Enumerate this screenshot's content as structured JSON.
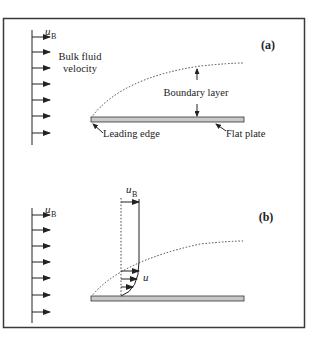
{
  "figure": {
    "top_caption_fragment": "…",
    "colors": {
      "frame": "#3a3a3a",
      "line": "#222222",
      "plate_fill": "#c8c8c8",
      "dotted": "#444444"
    }
  },
  "panel_a": {
    "tag": "(a)",
    "velocity_symbol": "u",
    "velocity_subscript": "B",
    "bulk_label_line1": "Bulk fluid",
    "bulk_label_line2": "velocity",
    "boundary_label": "Boundary layer",
    "leading_edge_label": "Leading edge",
    "flat_plate_label": "Flat plate",
    "arrow_count": 7
  },
  "panel_b": {
    "tag": "(b)",
    "velocity_symbol": "u",
    "velocity_subscript": "B",
    "profile_top_symbol": "u",
    "profile_top_subscript": "B",
    "profile_local_symbol": "u",
    "arrow_count": 7
  }
}
